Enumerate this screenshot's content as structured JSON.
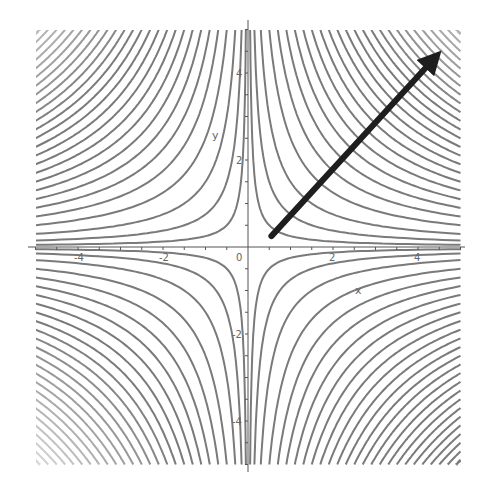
{
  "chart_data": {
    "type": "contour",
    "title": "",
    "function": "f(x, y) = x*y",
    "xlabel": "x",
    "ylabel": "y",
    "xlim": [
      -5,
      5
    ],
    "ylim": [
      -5,
      5
    ],
    "x_ticks": [
      -4,
      -2,
      0,
      2,
      4
    ],
    "y_ticks": [
      -4,
      -2,
      2,
      4
    ],
    "x_tick_labels": [
      "-4",
      "-2",
      "0",
      "2",
      "4"
    ],
    "y_tick_labels": [
      "-4",
      "-2",
      "2",
      "4"
    ],
    "contour_levels": [
      0.25,
      0.75,
      1.5,
      2.5,
      3.5,
      4.5,
      5.5,
      6.5,
      7.5,
      8.5,
      9.5,
      10.5,
      11.5,
      12.5,
      13.5,
      14.5,
      15.5,
      16.5,
      17.5,
      18.5,
      19.5,
      20.5,
      21.5,
      22.5,
      23.5,
      24.5
    ],
    "contour_levels_note": "levels apply symmetrically: +c in quadrants I/III, -c in quadrants II/IV",
    "grid": false,
    "legend": null,
    "annotations": [
      {
        "type": "arrow",
        "label": "gradient direction",
        "from": [
          0.55,
          0.25
        ],
        "to": [
          4.5,
          4.45
        ]
      }
    ],
    "colors": {
      "contour": "#7a7a7a",
      "contour_faded": "#d8d8d8",
      "axis": "#555555",
      "arrow": "#1e1e1e"
    }
  },
  "layout": {
    "origin_px": [
      248,
      247
    ],
    "unit_px_x": 42.5,
    "unit_px_y": 43.5
  }
}
